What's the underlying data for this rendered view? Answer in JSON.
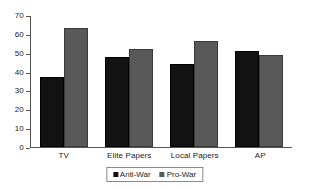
{
  "chart_data": {
    "type": "bar",
    "title": "",
    "subtitle": "",
    "xlabel": "",
    "ylabel": "",
    "categories": [
      "TV",
      "Elite Papers",
      "Local Papers",
      "AP"
    ],
    "series": [
      {
        "name": "Anti-War",
        "color": "#121212",
        "values": [
          37,
          48,
          44,
          51
        ]
      },
      {
        "name": "Pro-War",
        "color": "#595959",
        "values": [
          63,
          52,
          56,
          49
        ]
      }
    ],
    "ylim": [
      0,
      70
    ],
    "ytick_step": 10,
    "yticks": [
      0,
      10,
      20,
      30,
      40,
      50,
      60,
      70
    ],
    "ytick_labels": [
      "0",
      "10",
      "20",
      "30",
      "40",
      "50",
      "60",
      "70"
    ],
    "grid": false,
    "legend_position": "bottom-center",
    "annotations": []
  },
  "legend": {
    "entries": [
      {
        "label": "Anti-War",
        "swatch": "legend-swatch-anti-war"
      },
      {
        "label": "Pro-War",
        "swatch": "legend-swatch-pro-war"
      }
    ]
  },
  "colors": {
    "anti_war": "#121212",
    "pro_war": "#595959",
    "axis": "#555555",
    "background": "#ffffff"
  }
}
